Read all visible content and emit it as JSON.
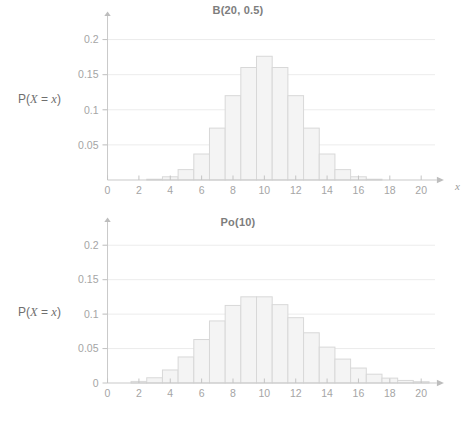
{
  "page": {
    "background": "#ffffff",
    "axis_color": "#c9c9c9",
    "grid_color": "#ececec",
    "bar_fill": "#f4f4f4",
    "bar_stroke": "#d8d8d8",
    "text_color": "#9a9a9a"
  },
  "chart_data": [
    {
      "type": "bar",
      "title": "B(20, 0.5)",
      "xlabel": "x",
      "ylabel": "P(X = x)",
      "ylabel_parts": {
        "prefix": "P(",
        "var1": "X",
        "middle": " = ",
        "var2": "x",
        "suffix": ")"
      },
      "xlim": [
        -0.8,
        21.2
      ],
      "ylim": [
        0,
        0.225
      ],
      "grid": true,
      "grid_values": [
        0.05,
        0.1,
        0.15,
        0.2
      ],
      "ytick_labels": [
        "0.05",
        "0.1",
        "0.15",
        "0.2"
      ],
      "ytick_values": [
        0.05,
        0.1,
        0.15,
        0.2
      ],
      "xtick_labels": [
        "0",
        "2",
        "4",
        "6",
        "8",
        "10",
        "12",
        "14",
        "16",
        "18",
        "20"
      ],
      "xtick_values": [
        0,
        2,
        4,
        6,
        8,
        10,
        12,
        14,
        16,
        18,
        20
      ],
      "categories": [
        0,
        1,
        2,
        3,
        4,
        5,
        6,
        7,
        8,
        9,
        10,
        11,
        12,
        13,
        14,
        15,
        16,
        17,
        18,
        19,
        20
      ],
      "values": [
        0.0,
        0.0,
        0.0002,
        0.0011,
        0.0046,
        0.0148,
        0.037,
        0.0739,
        0.1201,
        0.1602,
        0.1762,
        0.1602,
        0.1201,
        0.0739,
        0.037,
        0.0148,
        0.0046,
        0.0011,
        0.0002,
        0.0,
        0.0
      ],
      "legend": null
    },
    {
      "type": "bar",
      "title": "Po(10)",
      "xlabel": "x",
      "ylabel": "P(X = x)",
      "ylabel_parts": {
        "prefix": "P(",
        "var1": "X",
        "middle": " = ",
        "var2": "x",
        "suffix": ")"
      },
      "xlim": [
        -0.8,
        21.2
      ],
      "ylim": [
        0,
        0.225
      ],
      "grid": true,
      "grid_values": [
        0.05,
        0.1,
        0.15,
        0.2
      ],
      "ytick_labels": [
        "0",
        "0.05",
        "0.1",
        "0.15",
        "0.2"
      ],
      "ytick_values": [
        0,
        0.05,
        0.1,
        0.15,
        0.2
      ],
      "xtick_labels": [
        "0",
        "2",
        "4",
        "6",
        "8",
        "10",
        "12",
        "14",
        "16",
        "18",
        "20"
      ],
      "xtick_values": [
        0,
        2,
        4,
        6,
        8,
        10,
        12,
        14,
        16,
        18,
        20
      ],
      "categories": [
        0,
        1,
        2,
        3,
        4,
        5,
        6,
        7,
        8,
        9,
        10,
        11,
        12,
        13,
        14,
        15,
        16,
        17,
        18,
        19,
        20
      ],
      "values": [
        0.0,
        0.0005,
        0.0023,
        0.0076,
        0.0189,
        0.0378,
        0.0631,
        0.0901,
        0.1126,
        0.1251,
        0.1251,
        0.1137,
        0.0948,
        0.0729,
        0.0521,
        0.0347,
        0.0217,
        0.0128,
        0.0071,
        0.0037,
        0.0019
      ],
      "legend": null
    }
  ]
}
